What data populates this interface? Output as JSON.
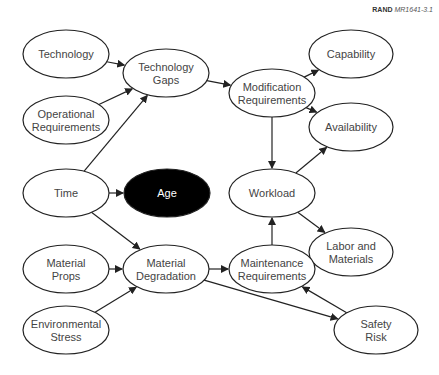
{
  "figure_tag": {
    "org": "RAND",
    "id": "MR1641-3.1"
  },
  "colors": {
    "stroke": "#222222",
    "fill": "#ffffff",
    "dark_fill": "#000000",
    "text": "#444444",
    "dark_text": "#ffffff"
  },
  "nodes": [
    {
      "id": "technology",
      "lines": [
        "Technology"
      ],
      "cx": 66,
      "cy": 54,
      "rx": 43,
      "ry": 24
    },
    {
      "id": "operational-requirements",
      "lines": [
        "Operational",
        "Requirements"
      ],
      "cx": 66,
      "cy": 120,
      "rx": 43,
      "ry": 24
    },
    {
      "id": "technology-gaps",
      "lines": [
        "Technology",
        "Gaps"
      ],
      "cx": 166,
      "cy": 73,
      "rx": 43,
      "ry": 24
    },
    {
      "id": "modification-requirements",
      "lines": [
        "Modification",
        "Requirements"
      ],
      "cx": 272,
      "cy": 93,
      "rx": 43,
      "ry": 24
    },
    {
      "id": "capability",
      "lines": [
        "Capability"
      ],
      "cx": 351,
      "cy": 54,
      "rx": 42,
      "ry": 24
    },
    {
      "id": "availability",
      "lines": [
        "Availability"
      ],
      "cx": 351,
      "cy": 127,
      "rx": 42,
      "ry": 24
    },
    {
      "id": "time",
      "lines": [
        "Time"
      ],
      "cx": 66,
      "cy": 193,
      "rx": 43,
      "ry": 24
    },
    {
      "id": "age",
      "lines": [
        "Age"
      ],
      "cx": 167,
      "cy": 193,
      "rx": 43,
      "ry": 24,
      "dark": true
    },
    {
      "id": "workload",
      "lines": [
        "Workload"
      ],
      "cx": 272,
      "cy": 193,
      "rx": 43,
      "ry": 24
    },
    {
      "id": "labor-and-materials",
      "lines": [
        "Labor and",
        "Materials"
      ],
      "cx": 351,
      "cy": 252,
      "rx": 42,
      "ry": 24
    },
    {
      "id": "material-props",
      "lines": [
        "Material",
        "Props"
      ],
      "cx": 66,
      "cy": 269,
      "rx": 43,
      "ry": 24
    },
    {
      "id": "material-degradation",
      "lines": [
        "Material",
        "Degradation"
      ],
      "cx": 166,
      "cy": 269,
      "rx": 43,
      "ry": 24
    },
    {
      "id": "maintenance-requirements",
      "lines": [
        "Maintenance",
        "Requirements"
      ],
      "cx": 272,
      "cy": 269,
      "rx": 43,
      "ry": 24
    },
    {
      "id": "environmental-stress",
      "lines": [
        "Environmental",
        "Stress"
      ],
      "cx": 66,
      "cy": 330,
      "rx": 43,
      "ry": 24
    },
    {
      "id": "safety-risk",
      "lines": [
        "Safety",
        "Risk"
      ],
      "cx": 376,
      "cy": 330,
      "rx": 42,
      "ry": 24
    }
  ],
  "edges": [
    {
      "from": "technology",
      "to": "technology-gaps"
    },
    {
      "from": "operational-requirements",
      "to": "technology-gaps"
    },
    {
      "from": "time",
      "to": "technology-gaps"
    },
    {
      "from": "technology-gaps",
      "to": "modification-requirements"
    },
    {
      "from": "modification-requirements",
      "to": "capability"
    },
    {
      "from": "modification-requirements",
      "to": "availability"
    },
    {
      "from": "modification-requirements",
      "to": "workload"
    },
    {
      "from": "time",
      "to": "age"
    },
    {
      "from": "time",
      "to": "material-degradation"
    },
    {
      "from": "workload",
      "to": "availability"
    },
    {
      "from": "workload",
      "to": "labor-and-materials"
    },
    {
      "from": "material-props",
      "to": "material-degradation"
    },
    {
      "from": "environmental-stress",
      "to": "material-degradation"
    },
    {
      "from": "material-degradation",
      "to": "maintenance-requirements"
    },
    {
      "from": "material-degradation",
      "to": "safety-risk"
    },
    {
      "from": "maintenance-requirements",
      "to": "workload"
    },
    {
      "from": "safety-risk",
      "to": "maintenance-requirements"
    }
  ]
}
